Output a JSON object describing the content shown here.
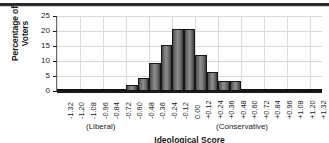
{
  "chart_data": {
    "type": "bar",
    "title": "",
    "xlabel": "Ideological Score",
    "ylabel": "Percentage of Voters",
    "xlim": [
      -1.38,
      1.38
    ],
    "ylim": [
      0,
      25
    ],
    "grid": true,
    "legend": null,
    "bin_width": 0.12,
    "categories": [
      "-1.32",
      "-1.20",
      "-1.08",
      "-0.96",
      "-0.84",
      "-0.72",
      "-0.60",
      "-0.48",
      "-0.36",
      "-0.24",
      "-0.12",
      "0.00",
      "+0.12",
      "+0.24",
      "+0.36",
      "+0.48",
      "+0.60",
      "+0.72",
      "+0.84",
      "+0.96",
      "+1.08",
      "+1.20",
      "+1.32"
    ],
    "values": [
      0.2,
      0.0,
      0.0,
      0.0,
      0.2,
      0.5,
      2.1,
      4.2,
      9.2,
      15.4,
      20.7,
      20.7,
      12.1,
      6.3,
      3.4,
      3.2,
      0.5,
      0.3,
      0.0,
      0.0,
      0.0,
      0.0,
      0.0
    ],
    "ytick_labels": [
      "0",
      "5",
      "10",
      "15",
      "20",
      "25"
    ],
    "ytick_values": [
      0,
      5,
      10,
      15,
      20,
      25
    ],
    "xtick_labels": [
      "-1.32",
      "-1.20",
      "-1.08",
      "-0.96",
      "-0.84",
      "-0.72",
      "-0.60",
      "-0.48",
      "-0.36",
      "-0.24",
      "-0.12",
      "0.00",
      "+0.12",
      "+0.24",
      "+0.36",
      "+0.48",
      "+0.60",
      "+0.72",
      "+0.84",
      "+0.96",
      "+1.08",
      "+1.20",
      "+1.32"
    ],
    "annotations": [
      {
        "text": "(Liberal)",
        "position": "left"
      },
      {
        "text": "(Conservative)",
        "position": "right"
      }
    ]
  },
  "axes": {
    "y_title": "Percentage of Voters",
    "x_title": "Ideological Score"
  },
  "labels": {
    "liberal": "(Liberal)",
    "conservative": "(Conservative)"
  },
  "style": {
    "bar_fill": "#6e6e6e",
    "bar_edge": "#171717",
    "grid_color": "#d8d8d8",
    "axis_color": "#1a1a1a",
    "background": "#ffffff"
  }
}
